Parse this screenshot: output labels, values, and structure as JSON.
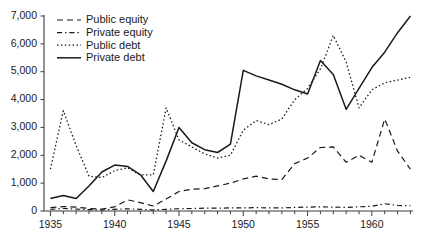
{
  "chart_data": {
    "type": "line",
    "title": "",
    "xlabel": "",
    "ylabel": "",
    "xlim": [
      1934.5,
      1963.2
    ],
    "ylim": [
      0,
      7000
    ],
    "grid": false,
    "legend_position": "top-left",
    "y_ticks": [
      0,
      1000,
      2000,
      3000,
      4000,
      5000,
      6000,
      7000
    ],
    "y_tick_labels": [
      "0",
      "1,000",
      "2,000",
      "3,000",
      "4,000",
      "5,000",
      "6,000",
      "7,000"
    ],
    "x_ticks": [
      1935,
      1936,
      1937,
      1938,
      1939,
      1940,
      1941,
      1942,
      1943,
      1944,
      1945,
      1946,
      1947,
      1948,
      1949,
      1950,
      1951,
      1952,
      1953,
      1954,
      1955,
      1956,
      1957,
      1958,
      1959,
      1960,
      1961,
      1962,
      1963
    ],
    "x_tick_labels": [
      {
        "value": 1935,
        "label": "1935"
      },
      {
        "value": 1940,
        "label": "1940"
      },
      {
        "value": 1945,
        "label": "1945"
      },
      {
        "value": 1950,
        "label": "1950"
      },
      {
        "value": 1955,
        "label": "1955"
      },
      {
        "value": 1960,
        "label": "1960"
      }
    ],
    "x": [
      1935,
      1936,
      1937,
      1938,
      1939,
      1940,
      1941,
      1942,
      1943,
      1944,
      1945,
      1946,
      1947,
      1948,
      1949,
      1950,
      1951,
      1952,
      1953,
      1954,
      1955,
      1956,
      1957,
      1958,
      1959,
      1960,
      1961,
      1962,
      1963
    ],
    "series": [
      {
        "name": "Public equity",
        "style": "dashed",
        "color": "#1a1a1a",
        "values": [
          120,
          160,
          140,
          90,
          70,
          150,
          400,
          300,
          180,
          430,
          700,
          780,
          800,
          900,
          1000,
          1150,
          1250,
          1150,
          1130,
          1700,
          1900,
          2280,
          2300,
          1750,
          2000,
          1750,
          3300,
          2150,
          1500
        ]
      },
      {
        "name": "Private equity",
        "style": "dash-dot",
        "color": "#1a1a1a",
        "values": [
          60,
          90,
          70,
          50,
          40,
          60,
          80,
          60,
          40,
          60,
          80,
          90,
          100,
          100,
          110,
          110,
          120,
          110,
          110,
          130,
          140,
          150,
          140,
          130,
          150,
          170,
          260,
          200,
          190
        ]
      },
      {
        "name": "Public debt",
        "style": "dotted",
        "color": "#1a1a1a",
        "values": [
          1500,
          3600,
          2350,
          1250,
          1200,
          1450,
          1550,
          1300,
          1300,
          3700,
          2550,
          2300,
          2050,
          1900,
          2000,
          2900,
          3250,
          3100,
          3300,
          4000,
          4400,
          5100,
          6300,
          5350,
          3700,
          4350,
          4600,
          4700,
          4800
        ]
      },
      {
        "name": "Private debt",
        "style": "solid",
        "color": "#1a1a1a",
        "values": [
          450,
          560,
          450,
          900,
          1400,
          1650,
          1600,
          1300,
          700,
          1800,
          3000,
          2450,
          2200,
          2100,
          2400,
          5050,
          4850,
          4700,
          4550,
          4350,
          4200,
          5400,
          4900,
          3650,
          4400,
          5150,
          5700,
          6400,
          7000
        ]
      }
    ],
    "legend": [
      {
        "label": "Public equity",
        "style": "dashed"
      },
      {
        "label": "Private equity",
        "style": "dash-dot"
      },
      {
        "label": "Public debt",
        "style": "dotted"
      },
      {
        "label": "Private debt",
        "style": "solid"
      }
    ]
  }
}
